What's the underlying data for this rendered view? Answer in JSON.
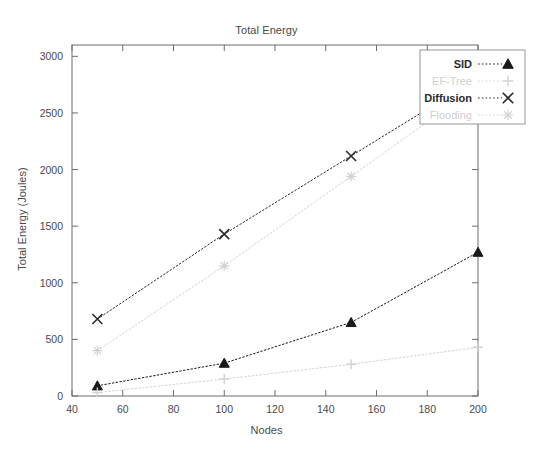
{
  "chart_data": {
    "type": "line",
    "title": "Total Energy",
    "xlabel": "Nodes",
    "ylabel": "Total Energy (Joules)",
    "x": [
      50,
      100,
      150,
      200
    ],
    "xlim": [
      40,
      200
    ],
    "ylim": [
      0,
      3100
    ],
    "xticks": [
      40,
      60,
      80,
      100,
      120,
      140,
      160,
      180,
      200
    ],
    "yticks": [
      0,
      500,
      1000,
      1500,
      2000,
      2500,
      3000
    ],
    "grid": false,
    "legend_position": "top-right",
    "series": [
      {
        "name": "SID",
        "marker": "triangle",
        "color": "#1a1a1a",
        "values": [
          90,
          290,
          650,
          1270
        ]
      },
      {
        "name": "EF-Tree",
        "marker": "plus",
        "color": "#d2d2d2",
        "values": [
          30,
          150,
          280,
          430
        ]
      },
      {
        "name": "Diffusion",
        "marker": "cross",
        "color": "#2b2b2b",
        "values": [
          680,
          1430,
          2120,
          2810
        ]
      },
      {
        "name": "Flooding",
        "marker": "star",
        "color": "#d2d2d2",
        "values": [
          400,
          1150,
          1940,
          2740
        ]
      }
    ]
  },
  "legend": {
    "entries": [
      {
        "label": "SID"
      },
      {
        "label": "EF-Tree"
      },
      {
        "label": "Diffusion"
      },
      {
        "label": "Flooding"
      }
    ]
  },
  "xtick_labels": [
    "40",
    "60",
    "80",
    "100",
    "120",
    "140",
    "160",
    "180",
    "200"
  ],
  "ytick_labels": [
    "0",
    "500",
    "1000",
    "1500",
    "2000",
    "2500",
    "3000"
  ]
}
